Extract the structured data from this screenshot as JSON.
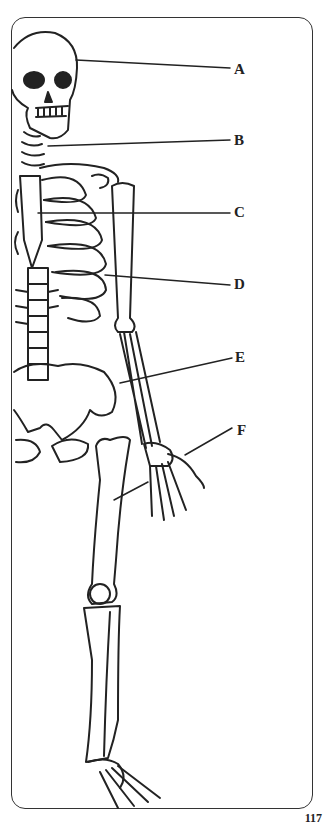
{
  "diagram": {
    "labels": [
      {
        "id": "A",
        "x": 234,
        "y": 62
      },
      {
        "id": "B",
        "x": 234,
        "y": 133
      },
      {
        "id": "C",
        "x": 234,
        "y": 205
      },
      {
        "id": "D",
        "x": 234,
        "y": 277
      },
      {
        "id": "E",
        "x": 235,
        "y": 350
      },
      {
        "id": "F",
        "x": 237,
        "y": 423
      }
    ]
  },
  "page": {
    "number": "117"
  },
  "colors": {
    "ink": "#222222",
    "frame": "#333333",
    "paper": "#ffffff"
  }
}
